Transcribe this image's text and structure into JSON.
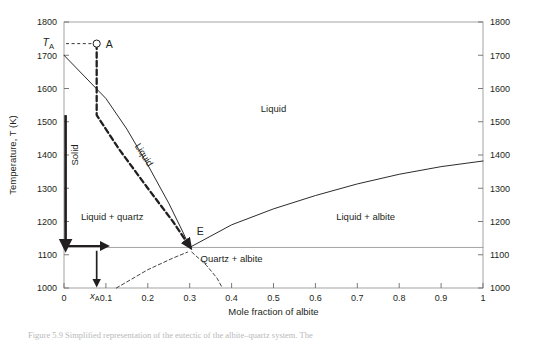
{
  "figure": {
    "caption": "Figure 5.9 Simplified representation of the eutectic of the albite–quartz system. The",
    "background": "#ffffff",
    "line_color": "#231f20"
  },
  "chart_data": {
    "type": "line",
    "title": "",
    "xlabel": "Mole fraction of albite",
    "ylabel": "Temperature, T (K)",
    "xlim": [
      0,
      1
    ],
    "ylim": [
      1000,
      1800
    ],
    "xticks": [
      "0",
      "0.1",
      "0.2",
      "0.3",
      "0.4",
      "0.5",
      "0.6",
      "0.7",
      "0.8",
      "0.9",
      "1"
    ],
    "xtick_values": [
      0,
      0.1,
      0.2,
      0.3,
      0.4,
      0.5,
      0.6,
      0.7,
      0.8,
      0.9,
      1
    ],
    "yticks": [
      "1000",
      "1100",
      "1200",
      "1300",
      "1400",
      "1500",
      "1600",
      "1700",
      "1800"
    ],
    "ytick_values": [
      1000,
      1100,
      1200,
      1300,
      1400,
      1500,
      1600,
      1700,
      1800
    ],
    "right_axis": true,
    "right_yticks": [
      "1000",
      "1100",
      "1200",
      "1300",
      "1400",
      "1500",
      "1600",
      "1700",
      "1800"
    ],
    "grid": false,
    "legend": "none",
    "series": [
      {
        "name": "quartz-liquidus",
        "style": "solid",
        "points": [
          [
            0,
            1700
          ],
          [
            0.05,
            1635
          ],
          [
            0.1,
            1570
          ],
          [
            0.15,
            1478
          ],
          [
            0.2,
            1370
          ],
          [
            0.25,
            1255
          ],
          [
            0.285,
            1165
          ],
          [
            0.3,
            1122
          ]
        ]
      },
      {
        "name": "albite-liquidus",
        "style": "solid",
        "points": [
          [
            0.3,
            1122
          ],
          [
            0.4,
            1190
          ],
          [
            0.5,
            1238
          ],
          [
            0.6,
            1278
          ],
          [
            0.7,
            1313
          ],
          [
            0.8,
            1342
          ],
          [
            0.9,
            1365
          ],
          [
            1.0,
            1382
          ]
        ]
      },
      {
        "name": "eutectic-horizontal",
        "style": "solid-thin",
        "points": [
          [
            0,
            1122
          ],
          [
            1.0,
            1122
          ]
        ]
      },
      {
        "name": "cooling-path",
        "style": "dashed-bold",
        "points": [
          [
            0.078,
            1735
          ],
          [
            0.078,
            1520
          ],
          [
            0.13,
            1420
          ],
          [
            0.2,
            1300
          ],
          [
            0.26,
            1200
          ],
          [
            0.3,
            1125
          ]
        ]
      },
      {
        "name": "solvus-left",
        "style": "dashed-thin",
        "points": [
          [
            0.125,
            1000
          ],
          [
            0.2,
            1055
          ],
          [
            0.26,
            1090
          ],
          [
            0.295,
            1108
          ]
        ]
      },
      {
        "name": "solvus-right",
        "style": "dashed-thin",
        "points": [
          [
            0.305,
            1108
          ],
          [
            0.34,
            1068
          ],
          [
            0.365,
            1030
          ],
          [
            0.378,
            1000
          ]
        ]
      }
    ],
    "annotations": [
      {
        "name": "point-A",
        "label": "A",
        "x": 0.078,
        "y": 1735,
        "marker": "open-circle"
      },
      {
        "name": "temperature-A-label",
        "label": "TA",
        "x": -0.07,
        "y": 1740
      },
      {
        "name": "composition-A-label",
        "label": "xA",
        "x": 0.078,
        "y": 985
      },
      {
        "name": "eutectic-label",
        "label": "E",
        "x": 0.325,
        "y": 1160
      },
      {
        "name": "liquid-region",
        "label": "Liquid",
        "x": 0.5,
        "y": 1530
      },
      {
        "name": "liquid-quartz-region",
        "label": "Liquid + quartz",
        "x": 0.115,
        "y": 1205
      },
      {
        "name": "liquid-albite-region",
        "label": "Liquid + albite",
        "x": 0.72,
        "y": 1205
      },
      {
        "name": "quartz-albite-region",
        "label": "Quartz + albite",
        "x": 0.4,
        "y": 1078
      },
      {
        "name": "liquidus-curve-label",
        "label": "Liquid",
        "x": 0.175,
        "y": 1395
      },
      {
        "name": "solid-bar-label",
        "label": "Solid",
        "x": 0.012,
        "y": 1400
      }
    ],
    "markers": {
      "solid_bar": {
        "x": 0,
        "y_top": 1520,
        "y_bottom": 1122
      },
      "horizontal_arrow": {
        "y": 1122,
        "x_from": 0,
        "x_to": 0.1
      },
      "vertical_arrow": {
        "x": 0.078,
        "y_from": 1112,
        "y_to": 1012
      }
    }
  }
}
